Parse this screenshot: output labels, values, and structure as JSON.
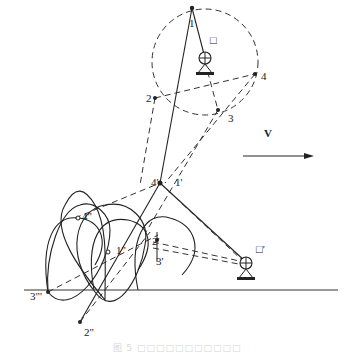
{
  "diagram": {
    "labels": {
      "p1": "1",
      "p2": "2",
      "p3": "3",
      "p4": "4",
      "p1p": "1'",
      "p2p": "2'",
      "p3p": "3'",
      "p4p": "4'",
      "p1pp": "1\"",
      "p2pp": "2\"",
      "p4pp": "4\"",
      "p3ppp": "3\"'",
      "pivot_top": "□",
      "pivot_bottom": "□'",
      "velocity": "V"
    },
    "caption": "图 5  □□□□□□□□□□□"
  }
}
